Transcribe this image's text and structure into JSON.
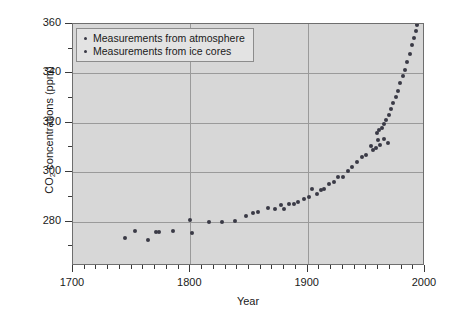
{
  "chart_data": {
    "type": "scatter",
    "title": "",
    "xlabel": "Year",
    "ylabel": "CO2 concentrations (ppm)",
    "ylabel_parts": {
      "prefix": "CO",
      "sub": "2",
      "suffix": " concentrations (ppm)"
    },
    "xlim": [
      1700,
      2000
    ],
    "ylim": [
      262,
      360
    ],
    "grid": true,
    "legend_position": "top-left",
    "x_ticks": [
      1700,
      1800,
      1900,
      2000
    ],
    "x_tick_labels": [
      "1700",
      "1800",
      "1900",
      "2000"
    ],
    "x_minor_step": 10,
    "y_ticks": [
      280,
      300,
      320,
      340,
      360
    ],
    "y_tick_labels": [
      "280",
      "300",
      "320",
      "340",
      "360"
    ],
    "y_minor_step": 10,
    "marker_color": "#3a3a46",
    "plot_background": "#d7d7d7",
    "grid_color": "#9a9a9a",
    "series": [
      {
        "name": "Measurements from ice cores",
        "marker": "circle",
        "points": [
          [
            1744,
            273.4
          ],
          [
            1753,
            276.0
          ],
          [
            1764,
            272.6
          ],
          [
            1771,
            275.6
          ],
          [
            1773,
            275.7
          ],
          [
            1785,
            276.1
          ],
          [
            1800,
            280.6
          ],
          [
            1801,
            275.3
          ],
          [
            1816,
            279.8
          ],
          [
            1827,
            280.0
          ],
          [
            1838,
            280.2
          ],
          [
            1847,
            282.4
          ],
          [
            1853,
            283.6
          ],
          [
            1858,
            284.0
          ],
          [
            1866,
            285.4
          ],
          [
            1872,
            285.0
          ],
          [
            1877,
            286.6
          ],
          [
            1880,
            285.0
          ],
          [
            1884,
            287.0
          ],
          [
            1888,
            287.2
          ],
          [
            1892,
            288.0
          ],
          [
            1897,
            289.2
          ],
          [
            1901,
            290.0
          ],
          [
            1904,
            293.4
          ],
          [
            1908,
            291.0
          ],
          [
            1911,
            292.8
          ],
          [
            1914,
            293.0
          ],
          [
            1918,
            295.4
          ],
          [
            1922,
            296.0
          ],
          [
            1926,
            298.2
          ],
          [
            1930,
            298.0
          ],
          [
            1934,
            300.4
          ],
          [
            1938,
            302.0
          ],
          [
            1942,
            304.0
          ],
          [
            1946,
            306.2
          ],
          [
            1950,
            307.0
          ],
          [
            1954,
            310.6
          ],
          [
            1956,
            309.0
          ],
          [
            1958,
            310.0
          ],
          [
            1960,
            313.0
          ],
          [
            1962,
            311.2
          ],
          [
            1965,
            313.4
          ],
          [
            1968,
            312.0
          ]
        ]
      },
      {
        "name": "Measurements from atmosphere",
        "marker": "circle",
        "points": [
          [
            1959,
            315.8
          ],
          [
            1961,
            317.0
          ],
          [
            1963,
            318.0
          ],
          [
            1965,
            319.5
          ],
          [
            1967,
            321.0
          ],
          [
            1969,
            323.0
          ],
          [
            1971,
            325.5
          ],
          [
            1973,
            328.0
          ],
          [
            1975,
            330.5
          ],
          [
            1977,
            333.0
          ],
          [
            1979,
            336.0
          ],
          [
            1981,
            339.0
          ],
          [
            1983,
            341.5
          ],
          [
            1985,
            344.5
          ],
          [
            1987,
            348.0
          ],
          [
            1989,
            351.5
          ],
          [
            1991,
            354.5
          ],
          [
            1992,
            357.0
          ],
          [
            1993,
            359.5
          ]
        ]
      }
    ]
  },
  "legend": {
    "entries": [
      {
        "label": "Measurements from atmosphere"
      },
      {
        "label": "Measurements from ice cores"
      }
    ]
  }
}
